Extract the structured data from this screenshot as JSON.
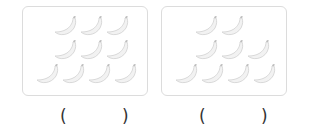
{
  "panels": [
    {
      "name": "panel-1",
      "banana_count": 10,
      "rows": [
        3,
        3,
        4
      ]
    },
    {
      "name": "panel-2",
      "banana_count": 9,
      "rows": [
        2,
        3,
        4
      ]
    }
  ],
  "answers": [
    {
      "open": "(",
      "close": ")",
      "value": ""
    },
    {
      "open": "(",
      "close": ")",
      "value": ""
    }
  ],
  "icon": "banana-icon",
  "colors": {
    "border": "#dcdcdc",
    "banana_fill": "#f2f2f2",
    "banana_stroke": "#d0d0d0",
    "paren": "#333333"
  }
}
